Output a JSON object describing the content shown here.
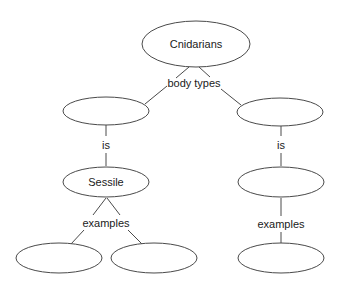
{
  "diagram": {
    "type": "concept-map",
    "nodes": [
      {
        "id": "root",
        "label": "Cnidarians"
      },
      {
        "id": "body-left",
        "label": ""
      },
      {
        "id": "body-right",
        "label": ""
      },
      {
        "id": "sessile",
        "label": "Sessile"
      },
      {
        "id": "right-mid",
        "label": ""
      },
      {
        "id": "ex-left-1",
        "label": ""
      },
      {
        "id": "ex-left-2",
        "label": ""
      },
      {
        "id": "ex-right",
        "label": ""
      }
    ],
    "links": [
      {
        "from": "root",
        "to": [
          "body-left",
          "body-right"
        ],
        "label": "body types"
      },
      {
        "from": "body-left",
        "to": [
          "sessile"
        ],
        "label": "is"
      },
      {
        "from": "body-right",
        "to": [
          "right-mid"
        ],
        "label": "is"
      },
      {
        "from": "sessile",
        "to": [
          "ex-left-1",
          "ex-left-2"
        ],
        "label": "examples"
      },
      {
        "from": "right-mid",
        "to": [
          "ex-right"
        ],
        "label": "examples"
      }
    ]
  }
}
